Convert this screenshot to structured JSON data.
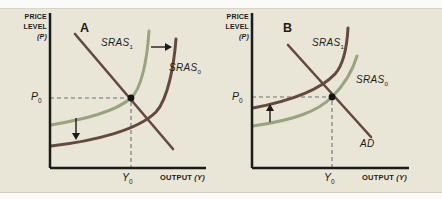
{
  "colors": {
    "figure_background": "#e9e6d8",
    "axis": "#1d1b17",
    "sras_dark": "#64493f",
    "sras_green": "#99a37d",
    "ad_line": "#64493f",
    "dashed_guide": "#6f6f6f",
    "equilibrium_dot": "#171512",
    "shift_arrow": "#1d1b17"
  },
  "panel_a": {
    "panel_label": "A",
    "y_axis_lines": [
      "PRICE",
      "LEVEL",
      "(P)"
    ],
    "x_axis_label": "OUTPUT",
    "x_axis_var": "(Y)",
    "curve_sras1": {
      "base": "SRAS",
      "sub": "1"
    },
    "curve_sras0": {
      "base": "SRAS",
      "sub": "0"
    },
    "price_point": {
      "base": "P",
      "sub": "0"
    },
    "output_point": {
      "base": "Y",
      "sub": "0"
    }
  },
  "panel_b": {
    "panel_label": "B",
    "y_axis_lines": [
      "PRICE",
      "LEVEL",
      "(P)"
    ],
    "x_axis_label": "OUTPUT",
    "x_axis_var": "(Y)",
    "curve_sras1": {
      "base": "SRAS",
      "sub": "1"
    },
    "curve_sras0": {
      "base": "SRAS",
      "sub": "0"
    },
    "ad_label": "AD",
    "price_point": {
      "base": "P",
      "sub": "0"
    },
    "output_point": {
      "base": "Y",
      "sub": "0"
    }
  }
}
